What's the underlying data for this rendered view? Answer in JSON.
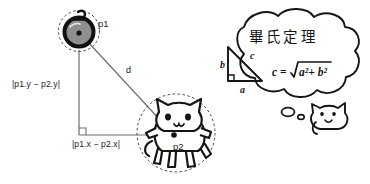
{
  "diagram": {
    "points": {
      "p1": {
        "label": "p1",
        "icon": "bomb-icon",
        "x": 79,
        "y": 31,
        "selection_radius": 21
      },
      "p2": {
        "label": "p2",
        "icon": "cat-icon",
        "x": 174,
        "y": 135,
        "selection_radius": 40
      }
    },
    "distance_label": "d",
    "leg_vertical_label": "|p1.y − p2.y|",
    "leg_horizontal_label": "|p1.x − p2.x|",
    "right_angle_marker": "right-angle-icon",
    "corner": {
      "x": 79,
      "y": 135
    }
  },
  "thought_bubble": {
    "icon": "thought-bubble-icon",
    "heading": "畢氏定理",
    "formula": {
      "lhs": "c",
      "equals": "=",
      "radical": "√",
      "radicand": "a² + b²",
      "full": "c = √(a² + b²)"
    },
    "triangle": {
      "side_a_label": "a",
      "side_b_label": "b",
      "side_c_label": "c",
      "right_angle_marker": "right-angle-icon"
    },
    "thinker": {
      "icon": "cat-head-icon",
      "trail_dots": 2
    }
  },
  "colors": {
    "ink": "#1a1a1a",
    "line": "#6e6e6e",
    "bomb_fill": "#8c8c8c",
    "dashed": "#555555",
    "background": "#ffffff"
  }
}
